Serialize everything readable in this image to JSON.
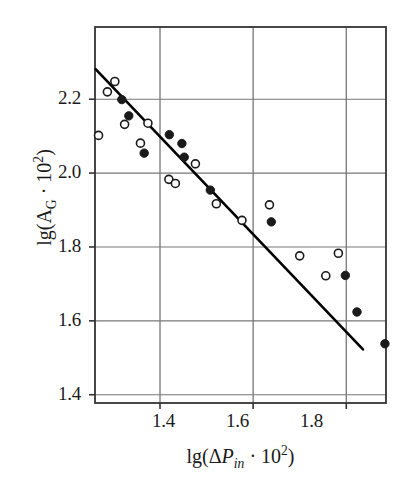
{
  "figure": {
    "background_color": "#ffffff",
    "frame_color": "#333333",
    "grid_color": "#777777",
    "line_color": "#000000",
    "marker_fill_color": "#1a1a1a",
    "marker_open_color": "#ffffff"
  },
  "axes": {
    "x_title_parts": {
      "prefix": "lg(",
      "delta": "Δ",
      "symbol": "P",
      "subscript": "in",
      "middot": " · 10",
      "exponent": "2",
      "suffix": ")"
    },
    "y_title_parts": {
      "prefix": "lg(A",
      "subscript": "G",
      "middot": " · 10",
      "exponent": "2",
      "suffix": ")"
    },
    "x_tick_labels": [
      "1.4",
      "1.6",
      "1.8"
    ],
    "y_tick_labels": [
      "2.2",
      "2.0",
      "1.8",
      "1.6",
      "1.4"
    ]
  },
  "chart_data": {
    "type": "scatter",
    "title": "",
    "xlabel": "lg(ΔP_in · 10^2)",
    "ylabel": "lg(A_G · 10^2)",
    "xlim": [
      1.2604,
      1.8853
    ],
    "ylim": [
      1.3776,
      2.3955
    ],
    "xticks": [
      1.4,
      1.6,
      1.8
    ],
    "yticks": [
      1.4,
      1.6,
      1.8,
      2.0,
      2.2
    ],
    "grid": true,
    "legend": "none",
    "series": [
      {
        "name": "open-circles",
        "marker": "open circle",
        "points": [
          [
            1.268,
            2.102
          ],
          [
            1.287,
            2.22
          ],
          [
            1.303,
            2.248
          ],
          [
            1.324,
            2.132
          ],
          [
            1.358,
            2.081
          ],
          [
            1.374,
            2.135
          ],
          [
            1.419,
            1.983
          ],
          [
            1.433,
            1.972
          ],
          [
            1.476,
            2.025
          ],
          [
            1.521,
            1.917
          ],
          [
            1.576,
            1.872
          ],
          [
            1.635,
            1.914
          ],
          [
            1.7,
            1.776
          ],
          [
            1.756,
            1.722
          ],
          [
            1.783,
            1.783
          ]
        ]
      },
      {
        "name": "filled-circles",
        "marker": "filled circle",
        "points": [
          [
            1.318,
            2.199
          ],
          [
            1.333,
            2.155
          ],
          [
            1.366,
            2.054
          ],
          [
            1.42,
            2.104
          ],
          [
            1.447,
            2.08
          ],
          [
            1.452,
            2.043
          ],
          [
            1.508,
            1.954
          ],
          [
            1.639,
            1.868
          ],
          [
            1.798,
            1.723
          ],
          [
            1.823,
            1.624
          ],
          [
            1.883,
            1.538
          ]
        ]
      }
    ],
    "trend_line": {
      "name": "regression-line",
      "x_start": 1.2617,
      "y_start": 2.2815,
      "x_end": 1.8358,
      "y_end": 1.5226
    }
  }
}
